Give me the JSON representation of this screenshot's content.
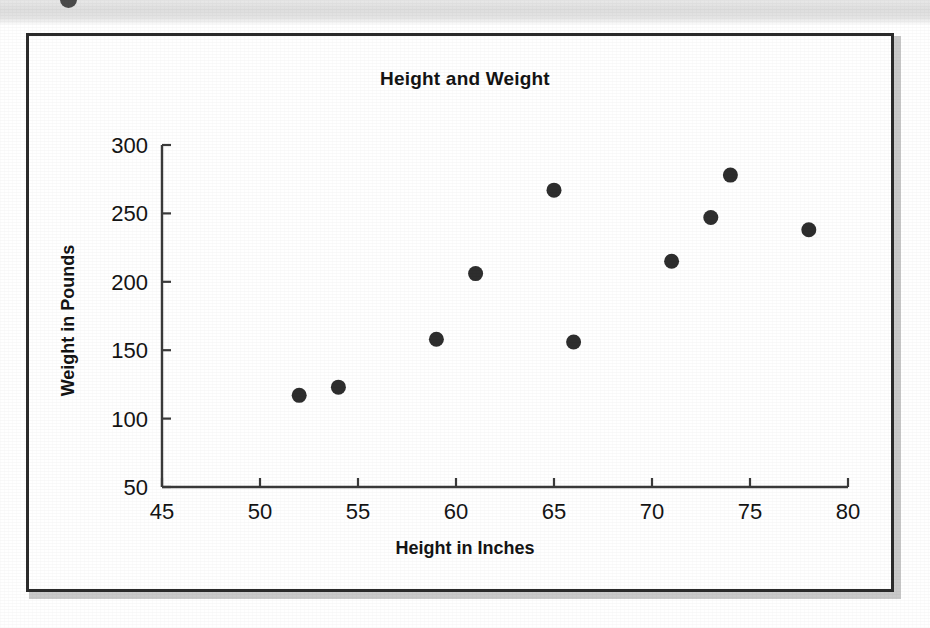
{
  "chart_data": {
    "type": "scatter",
    "title": "Height and Weight",
    "xlabel": "Height in Inches",
    "ylabel": "Weight in Pounds",
    "xlim": [
      45,
      80
    ],
    "ylim": [
      50,
      300
    ],
    "xticks": [
      45,
      50,
      55,
      60,
      65,
      70,
      75,
      80
    ],
    "yticks": [
      50,
      100,
      150,
      200,
      250,
      300
    ],
    "grid": false,
    "legend": false,
    "marker": {
      "shape": "circle",
      "color": "#2e2e2e",
      "size": 15
    },
    "series": [
      {
        "name": "observations",
        "points": [
          {
            "x": 52,
            "y": 117
          },
          {
            "x": 54,
            "y": 123
          },
          {
            "x": 59,
            "y": 158
          },
          {
            "x": 61,
            "y": 206
          },
          {
            "x": 65,
            "y": 267
          },
          {
            "x": 66,
            "y": 156
          },
          {
            "x": 71,
            "y": 215
          },
          {
            "x": 73,
            "y": 247
          },
          {
            "x": 74,
            "y": 278
          },
          {
            "x": 78,
            "y": 238
          }
        ]
      }
    ]
  },
  "figure": {
    "frame_color": "#2b2b2b",
    "background": "#ffffff",
    "axis_color": "#3a3a3a"
  },
  "page": {
    "scan_band_color": "#e4e4e4",
    "corner_mark": "bullet-dot"
  }
}
